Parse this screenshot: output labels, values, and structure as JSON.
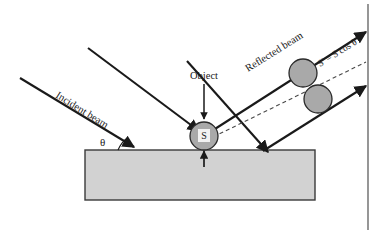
{
  "figure": {
    "labels": {
      "incident_beam": "Incident beam",
      "reflected_beam": "Reflected beam",
      "object": "Object",
      "angle": "θ",
      "object_area": "S",
      "projected_area": "S' = S cos θ"
    },
    "colors": {
      "background": "#ffffff",
      "line": "#1a1a1a",
      "substrate_fill": "#d2d2d2",
      "substrate_border": "#3a3a3a",
      "circle_fill": "#a9a9a9",
      "circle_border": "#2a2a2a",
      "s_box_fill": "#f2f2f2",
      "dashed_line": "#4a4a4a"
    },
    "geometry": {
      "substrate": {
        "x": 85,
        "y": 150,
        "width": 230,
        "height": 50
      },
      "incidence_angle_deg": 45,
      "object_circle": {
        "cx": 204,
        "cy": 136,
        "r": 14
      },
      "projected_circles": [
        {
          "cx": 303,
          "cy": 73,
          "r": 14
        },
        {
          "cx": 318,
          "cy": 99,
          "r": 14
        }
      ],
      "detector_plane_x": 368
    }
  }
}
